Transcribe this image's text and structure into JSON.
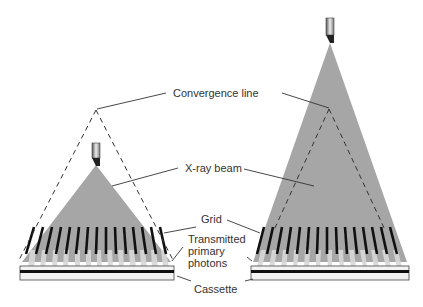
{
  "labels": {
    "convergence_line": "Convergence line",
    "xray_beam": "X-ray beam",
    "grid": "Grid",
    "transmitted": "Transmitted\nprimary\nphotons",
    "cassette": "Cassette"
  },
  "colors": {
    "beam": "#a6a6a6",
    "grid_strip": "#111111",
    "line": "#333333",
    "background": "#ffffff"
  },
  "panels": [
    {
      "name": "left",
      "description": "Grid with focus too close; beam apex below convergence line"
    },
    {
      "name": "right",
      "description": "Grid with focus too far; beam apex above convergence line"
    }
  ]
}
